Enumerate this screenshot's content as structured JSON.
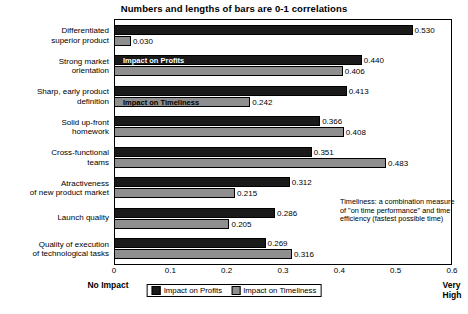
{
  "chart_data": {
    "type": "bar",
    "orientation": "horizontal",
    "title": "Numbers and lengths of bars are 0-1 correlations",
    "xlabel": "",
    "ylabel": "",
    "xlim": [
      0,
      0.6
    ],
    "xticks": [
      "0",
      "0.1",
      "0.2",
      "0.3",
      "0.4",
      "0.5",
      "0.6"
    ],
    "xtick_values": [
      0,
      0.1,
      0.2,
      0.3,
      0.4,
      0.5,
      0.6
    ],
    "grid": false,
    "legend_position": "bottom-center",
    "axis_left_label": "No Impact",
    "axis_right_label": "Very High",
    "annotation": "Timeliness: a combination measure of \"on time performance\" and time efficiency (fastest possible time)",
    "categories": [
      "Differentiated\nsuperior product",
      "Strong market\norientation",
      "Sharp, early product\ndefinition",
      "Solid up-front\nhomework",
      "Cross-functional\nteams",
      "Atractiveness\nof new product market",
      "Launch quality",
      "Quality of execution\nof technological tasks"
    ],
    "series": [
      {
        "name": "Impact on Profits",
        "color": "#1a1a1a",
        "values": [
          0.53,
          0.44,
          0.413,
          0.366,
          0.351,
          0.312,
          0.286,
          0.269
        ],
        "labels": [
          "0.530",
          "0.440",
          "0.413",
          "0.366",
          "0.351",
          "0.312",
          "0.286",
          "0.269"
        ],
        "in_bar_label": "Impact on Profits",
        "in_bar_label_row": 1
      },
      {
        "name": "Impact on Timeliness",
        "color": "#8f8f8f",
        "values": [
          0.03,
          0.406,
          0.242,
          0.408,
          0.483,
          0.215,
          0.205,
          0.316
        ],
        "labels": [
          "0.030",
          "0.406",
          "0.242",
          "0.408",
          "0.483",
          "0.215",
          "0.205",
          "0.316"
        ],
        "in_bar_label": "Impact on Timeliness",
        "in_bar_label_row": 2
      }
    ]
  }
}
